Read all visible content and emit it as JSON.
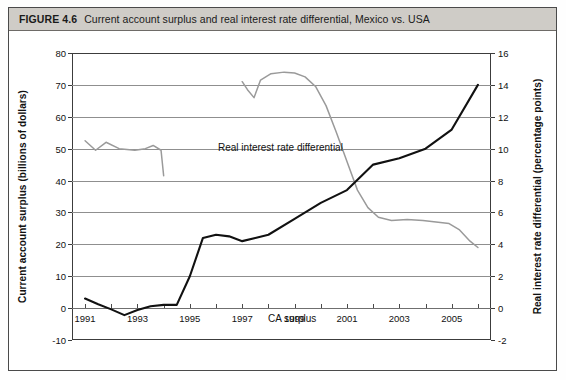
{
  "figure": {
    "number_label": "FIGURE 4.6",
    "caption": "Current account surplus and real interest rate differential, Mexico vs. USA"
  },
  "chart_data": {
    "type": "line",
    "title": "Current account surplus and real interest rate differential, Mexico vs. USA",
    "xlabel": "",
    "ylabel": "Current account surplus (billions of dollars)",
    "y2label": "Real interest rate differential (percentage points)",
    "xlim": [
      1990.5,
      2006.5
    ],
    "ylim": [
      -10,
      80
    ],
    "y2lim": [
      -2,
      16
    ],
    "grid": true,
    "legend_position": "inline-annotations",
    "x_ticks": [
      1991,
      1993,
      1995,
      1997,
      1999,
      2001,
      2003,
      2005
    ],
    "x_tick_labels": [
      "1991",
      "1993",
      "1995",
      "1997",
      "1999",
      "2001",
      "2003",
      "2005"
    ],
    "x_minor_ticks": [
      1992,
      1994,
      1996,
      1998,
      2000,
      2002,
      2004,
      2006
    ],
    "y_ticks": [
      -10,
      0,
      10,
      20,
      30,
      40,
      50,
      60,
      70,
      80
    ],
    "y_tick_labels": [
      "-10",
      "0",
      "10",
      "20",
      "30",
      "40",
      "50",
      "60",
      "70",
      "80"
    ],
    "y2_ticks": [
      -2,
      0,
      2,
      4,
      6,
      8,
      10,
      12,
      14,
      16
    ],
    "y2_tick_labels": [
      "-2",
      "0",
      "2",
      "4",
      "6",
      "8",
      "10",
      "12",
      "14",
      "16"
    ],
    "series": [
      {
        "name": "CA surplus",
        "annotation": "CA surplus",
        "axis": "left",
        "color": "#111111",
        "style": "solid-thick",
        "x": [
          1991,
          1991.5,
          1992,
          1992.5,
          1993,
          1993.5,
          1994,
          1994.5,
          1995,
          1995.5,
          1996,
          1996.5,
          1997,
          1997.5,
          1998,
          1999,
          2000,
          2001,
          2002,
          2003,
          2004,
          2005,
          2006
        ],
        "values": [
          3.0,
          1.2,
          -0.4,
          -2.2,
          -0.6,
          0.6,
          1.0,
          1.0,
          10.0,
          22.0,
          23.0,
          22.5,
          21.0,
          22.0,
          23.0,
          28.0,
          33.0,
          37.0,
          45.0,
          47.0,
          50.0,
          56.0,
          70.0
        ]
      },
      {
        "name": "Real interest rate differential",
        "annotation": "Real interest rate differential",
        "axis": "right",
        "color": "#9a9a9a",
        "style": "solid-thin",
        "segments": [
          {
            "x": [
              1991,
              1991.4,
              1991.8,
              1992.3,
              1992.9,
              1993.3,
              1993.6,
              1993.9,
              1994.0
            ],
            "values": [
              10.5,
              9.9,
              10.4,
              10.0,
              9.9,
              10.0,
              10.2,
              9.9,
              8.3
            ]
          },
          {
            "x": [
              1997.0,
              1997.2,
              1997.45,
              1997.7,
              1998.1,
              1998.6,
              1999.0,
              1999.4,
              1999.8,
              2000.2,
              2000.6,
              2001.0,
              2001.4,
              2001.8,
              2002.2,
              2002.7,
              2003.3,
              2003.9,
              2004.4,
              2004.9,
              2005.3,
              2005.7,
              2006.0
            ],
            "values": [
              14.2,
              13.7,
              13.2,
              14.3,
              14.7,
              14.8,
              14.75,
              14.5,
              13.9,
              12.7,
              11.0,
              9.2,
              7.4,
              6.3,
              5.7,
              5.5,
              5.55,
              5.5,
              5.4,
              5.3,
              4.9,
              4.2,
              3.8
            ]
          }
        ]
      }
    ]
  }
}
